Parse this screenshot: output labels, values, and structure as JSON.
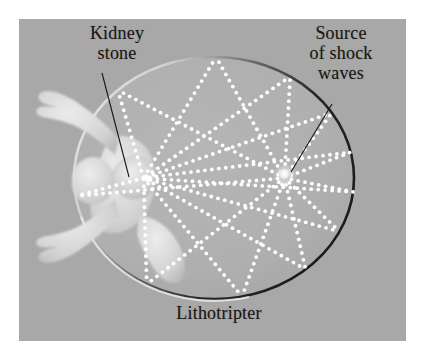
{
  "figure": {
    "canvas": {
      "width": 425,
      "height": 359
    },
    "panel": {
      "x": 19,
      "y": 19,
      "width": 387,
      "height": 322
    },
    "colors": {
      "page_background": "#ffffff",
      "panel_background": "#a8a8a8",
      "ellipse_interior": "#b0b0b0",
      "ellipse_rim_dark": "#2b2b2b",
      "ellipse_rim_light": "#e8e8e8",
      "ray_dot": "#ffffff",
      "body_fill": "#d8d8d8",
      "label_text": "#1a1613",
      "leader_line": "#1a1613",
      "source_dot": "#ffffff"
    }
  },
  "labels": {
    "kidney_stone": "Kidney\nstone",
    "source_of_shock_waves": "Source\nof shock\nwaves",
    "lithotripter": "Lithotripter"
  },
  "annotations": {
    "leader_kidney_stone": {
      "x1": 102,
      "y1": 73,
      "x2": 129,
      "y2": 177
    },
    "leader_source": {
      "x1": 332,
      "y1": 104,
      "x2": 291,
      "y2": 172
    }
  },
  "geometry": {
    "ellipse": {
      "cx": 214,
      "cy": 178,
      "rx": 140,
      "ry": 121
    },
    "focus_stone": {
      "x": 135,
      "y": 178
    },
    "focus_source": {
      "x": 285,
      "y": 175
    },
    "source_dot_radius": 6,
    "ray_count": 11,
    "ray_dot_radius": 1.9,
    "ray_dot_spacing": 7
  },
  "chart_data": {
    "type": "scatter",
    "title": "Lithotripter",
    "annotations": [
      "Kidney stone",
      "Source of shock waves",
      "Lithotripter"
    ],
    "series": [
      {
        "name": "shock-wave-rays",
        "description": "Dotted rays leaving the right focus, reflecting off the elliptical wall, converging at the left focus (kidney stone)."
      }
    ]
  }
}
